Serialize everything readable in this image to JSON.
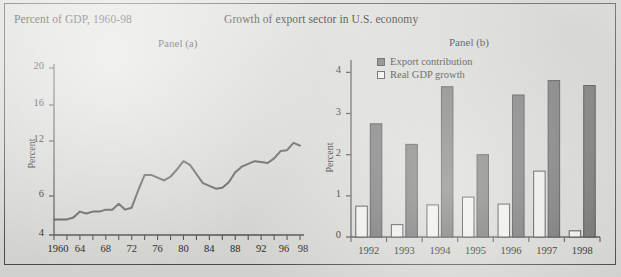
{
  "figure": {
    "caption_left": "Percent of GDP, 1960-98",
    "title": "Growth of export sector in U.S. economy",
    "panel_a_label": "Panel (a)",
    "panel_b_label": "Panel (b)",
    "background_color": "#d9d9d6",
    "border_color": "#4a4a48",
    "ink_color": "#4a4a48"
  },
  "chart_data": [
    {
      "type": "line",
      "title": "Panel (a)",
      "subtitle": "Percent of GDP, 1960-98",
      "xlabel": "",
      "ylabel": "Percent",
      "xlim": [
        1960,
        1998
      ],
      "ylim": [
        4,
        20
      ],
      "grid": false,
      "legend_position": "none",
      "ytick_labels": [
        "4",
        "6",
        "12",
        "16",
        "20"
      ],
      "ytick_values": [
        4,
        6,
        12,
        16,
        20
      ],
      "xtick_labels": [
        "1960",
        "64",
        "68",
        "72",
        "76",
        "80",
        "84",
        "88",
        "92",
        "96",
        "98"
      ],
      "xtick_values": [
        1960,
        1964,
        1968,
        1972,
        1976,
        1980,
        1984,
        1988,
        1992,
        1996,
        1998
      ],
      "minor_xtick_interval": 2,
      "series": [
        {
          "name": "Exports as percent of GDP",
          "color": "#595959",
          "x": [
            1960,
            1961,
            1962,
            1963,
            1964,
            1965,
            1966,
            1967,
            1968,
            1969,
            1970,
            1971,
            1972,
            1973,
            1974,
            1975,
            1976,
            1977,
            1978,
            1979,
            1980,
            1981,
            1982,
            1983,
            1984,
            1985,
            1986,
            1987,
            1988,
            1989,
            1990,
            1991,
            1992,
            1993,
            1994,
            1995,
            1996,
            1997,
            1998
          ],
          "values": [
            4.8,
            4.8,
            4.8,
            4.9,
            5.2,
            5.1,
            5.2,
            5.2,
            5.3,
            5.3,
            5.6,
            5.3,
            5.4,
            6.6,
            8.3,
            8.3,
            8.0,
            7.7,
            8.1,
            8.9,
            9.8,
            9.4,
            8.4,
            7.4,
            7.1,
            6.8,
            6.9,
            7.5,
            8.6,
            9.2,
            9.5,
            9.8,
            9.7,
            9.6,
            10.1,
            10.9,
            11.0,
            11.8,
            11.5
          ]
        }
      ]
    },
    {
      "type": "bar",
      "title": "Panel (b)",
      "xlabel": "",
      "ylabel": "Percent",
      "ylim": [
        0,
        4.3
      ],
      "grid": false,
      "legend_position": "top-left",
      "ytick_labels": [
        "0",
        "1",
        "2",
        "3",
        "4"
      ],
      "ytick_values": [
        0,
        1,
        2,
        3,
        4
      ],
      "categories": [
        "1992",
        "1993",
        "1994",
        "1995",
        "1996",
        "1997",
        "1998"
      ],
      "series": [
        {
          "name": "Real GDP growth",
          "color": "#f4f4f2",
          "edge_color": "#3a3a3a",
          "values": [
            0.75,
            0.3,
            0.78,
            0.97,
            0.8,
            1.6,
            0.15
          ]
        },
        {
          "name": "Export contribution",
          "color": "#6b6b6b",
          "edge_color": "#3a3a3a",
          "values": [
            2.75,
            2.25,
            3.65,
            2.0,
            3.45,
            3.8,
            3.68
          ]
        }
      ]
    }
  ],
  "legend": {
    "export_label": "Export contribution",
    "gdp_label": "Real GDP growth"
  }
}
